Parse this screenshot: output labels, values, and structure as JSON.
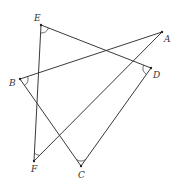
{
  "diagram": {
    "type": "geometry-figure",
    "points": [
      {
        "name": "E",
        "x": 41,
        "y": 25,
        "lx": 34,
        "ly": 21
      },
      {
        "name": "A",
        "x": 162,
        "y": 32,
        "lx": 164,
        "ly": 42
      },
      {
        "name": "D",
        "x": 151,
        "y": 68,
        "lx": 153,
        "ly": 78
      },
      {
        "name": "B",
        "x": 20,
        "y": 79,
        "lx": 9,
        "ly": 86
      },
      {
        "name": "F",
        "x": 34,
        "y": 161,
        "lx": 31,
        "ly": 172
      },
      {
        "name": "C",
        "x": 81,
        "y": 166,
        "lx": 78,
        "ly": 178
      }
    ],
    "segments": [
      [
        "E",
        "D"
      ],
      [
        "A",
        "B"
      ],
      [
        "A",
        "F"
      ],
      [
        "E",
        "F"
      ],
      [
        "B",
        "C"
      ],
      [
        "C",
        "D"
      ]
    ],
    "angle_marks": [
      "E",
      "D",
      "B",
      "F",
      "C"
    ],
    "labels": {
      "E": "E",
      "A": "A",
      "D": "D",
      "B": "B",
      "F": "F",
      "C": "C"
    }
  }
}
